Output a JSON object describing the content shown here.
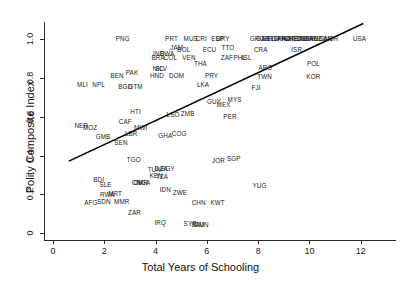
{
  "chart_data": {
    "type": "scatter",
    "title": "",
    "xlabel": "Total Years of Schooling",
    "ylabel": "Polity Composite Index",
    "xlim": [
      -0.35,
      13.1
    ],
    "ylim": [
      -0.035,
      1.09
    ],
    "xticks": [
      0,
      2,
      4,
      6,
      8,
      10,
      12
    ],
    "xticklabels": [
      "0",
      "2",
      "4",
      "6",
      "8",
      "10",
      "12"
    ],
    "yticks": [
      0,
      0.2,
      0.4,
      0.6,
      0.8,
      1.0
    ],
    "yticklabels": [
      "0",
      "0.2",
      "0.4",
      "0.6",
      "0.8",
      "1.0"
    ],
    "grid": false,
    "legend": null,
    "marker_style": "text-label",
    "trendline": {
      "type": "linear",
      "x_start": 0.62,
      "y_start": 0.372,
      "x_end": 12.1,
      "y_end": 1.082,
      "color": "#000000"
    },
    "points": [
      {
        "label": "PNG",
        "x": 2.72,
        "y": 1.0
      },
      {
        "label": "PRT",
        "x": 4.62,
        "y": 1.0
      },
      {
        "label": "MUS",
        "x": 5.37,
        "y": 1.0
      },
      {
        "label": "CRI",
        "x": 5.78,
        "y": 1.0
      },
      {
        "label": "ESP",
        "x": 6.42,
        "y": 1.0
      },
      {
        "label": "URY",
        "x": 6.62,
        "y": 1.0
      },
      {
        "label": "GRC",
        "x": 7.95,
        "y": 1.0
      },
      {
        "label": "GAB",
        "x": 8.18,
        "y": 1.0
      },
      {
        "label": "BEL",
        "x": 8.4,
        "y": 1.0
      },
      {
        "label": "IRL",
        "x": 8.55,
        "y": 1.0
      },
      {
        "label": "ITA",
        "x": 8.7,
        "y": 1.0
      },
      {
        "label": "JPN",
        "x": 8.85,
        "y": 1.0
      },
      {
        "label": "FRA",
        "x": 9.0,
        "y": 1.0
      },
      {
        "label": "AUT",
        "x": 9.15,
        "y": 1.0
      },
      {
        "label": "CHE",
        "x": 9.3,
        "y": 1.0
      },
      {
        "label": "NLD",
        "x": 9.45,
        "y": 1.0
      },
      {
        "label": "FIN",
        "x": 9.6,
        "y": 1.0
      },
      {
        "label": "DNK",
        "x": 9.75,
        "y": 1.0
      },
      {
        "label": "GBR",
        "x": 9.9,
        "y": 1.0
      },
      {
        "label": "SWE",
        "x": 10.05,
        "y": 1.0
      },
      {
        "label": "AUS",
        "x": 10.25,
        "y": 1.0
      },
      {
        "label": "NZL",
        "x": 10.4,
        "y": 1.0
      },
      {
        "label": "CAN",
        "x": 10.62,
        "y": 1.0
      },
      {
        "label": "NOR",
        "x": 10.85,
        "y": 1.0
      },
      {
        "label": "USA",
        "x": 11.95,
        "y": 1.0
      },
      {
        "label": "JAM",
        "x": 4.82,
        "y": 0.955
      },
      {
        "label": "BOL",
        "x": 5.1,
        "y": 0.945
      },
      {
        "label": "ECU",
        "x": 6.1,
        "y": 0.945
      },
      {
        "label": "TTO",
        "x": 6.82,
        "y": 0.955
      },
      {
        "label": "CRA",
        "x": 8.1,
        "y": 0.945
      },
      {
        "label": "IND",
        "x": 4.12,
        "y": 0.925
      },
      {
        "label": "BWA",
        "x": 4.45,
        "y": 0.925
      },
      {
        "label": "BRA",
        "x": 4.1,
        "y": 0.905
      },
      {
        "label": "COL",
        "x": 4.58,
        "y": 0.905
      },
      {
        "label": "VEN",
        "x": 5.3,
        "y": 0.905
      },
      {
        "label": "ZAF",
        "x": 6.78,
        "y": 0.905
      },
      {
        "label": "PHL",
        "x": 7.28,
        "y": 0.905
      },
      {
        "label": "ISL",
        "x": 7.55,
        "y": 0.905
      },
      {
        "label": "ISR",
        "x": 9.5,
        "y": 0.945
      },
      {
        "label": "POL",
        "x": 10.15,
        "y": 0.875
      },
      {
        "label": "THA",
        "x": 5.75,
        "y": 0.875
      },
      {
        "label": "NIC",
        "x": 4.1,
        "y": 0.845
      },
      {
        "label": "SLV",
        "x": 4.22,
        "y": 0.845
      },
      {
        "label": "ARG",
        "x": 8.28,
        "y": 0.855
      },
      {
        "label": "BEN",
        "x": 2.5,
        "y": 0.81
      },
      {
        "label": "PAK",
        "x": 3.08,
        "y": 0.825
      },
      {
        "label": "HND",
        "x": 4.05,
        "y": 0.81
      },
      {
        "label": "DOM",
        "x": 4.82,
        "y": 0.81
      },
      {
        "label": "PRY",
        "x": 6.18,
        "y": 0.81
      },
      {
        "label": "TWN",
        "x": 8.25,
        "y": 0.805
      },
      {
        "label": "KOR",
        "x": 10.15,
        "y": 0.805
      },
      {
        "label": "MLI",
        "x": 1.15,
        "y": 0.765
      },
      {
        "label": "NPL",
        "x": 1.78,
        "y": 0.765
      },
      {
        "label": "BGD",
        "x": 2.82,
        "y": 0.755
      },
      {
        "label": "GTM",
        "x": 3.22,
        "y": 0.755
      },
      {
        "label": "LKA",
        "x": 5.85,
        "y": 0.765
      },
      {
        "label": "FJI",
        "x": 7.92,
        "y": 0.75
      },
      {
        "label": "GUY",
        "x": 6.28,
        "y": 0.675
      },
      {
        "label": "MEX",
        "x": 6.65,
        "y": 0.66
      },
      {
        "label": "MYS",
        "x": 7.08,
        "y": 0.685
      },
      {
        "label": "HTI",
        "x": 3.22,
        "y": 0.625
      },
      {
        "label": "LSO",
        "x": 4.68,
        "y": 0.61
      },
      {
        "label": "ZMB",
        "x": 5.25,
        "y": 0.615
      },
      {
        "label": "PER",
        "x": 6.9,
        "y": 0.6
      },
      {
        "label": "CAF",
        "x": 2.82,
        "y": 0.575
      },
      {
        "label": "NER",
        "x": 1.1,
        "y": 0.555
      },
      {
        "label": "MOZ",
        "x": 1.45,
        "y": 0.545
      },
      {
        "label": "MWI",
        "x": 3.42,
        "y": 0.545
      },
      {
        "label": "LBR",
        "x": 3.05,
        "y": 0.51
      },
      {
        "label": "GMB",
        "x": 1.95,
        "y": 0.495
      },
      {
        "label": "GHA",
        "x": 4.38,
        "y": 0.5
      },
      {
        "label": "COG",
        "x": 4.92,
        "y": 0.51
      },
      {
        "label": "SEN",
        "x": 2.65,
        "y": 0.465
      },
      {
        "label": "TGO",
        "x": 3.15,
        "y": 0.38
      },
      {
        "label": "JOR",
        "x": 6.45,
        "y": 0.375
      },
      {
        "label": "SGP",
        "x": 7.05,
        "y": 0.385
      },
      {
        "label": "TUN",
        "x": 3.95,
        "y": 0.325
      },
      {
        "label": "DZA",
        "x": 4.22,
        "y": 0.33
      },
      {
        "label": "EGY",
        "x": 4.48,
        "y": 0.33
      },
      {
        "label": "KEN",
        "x": 4.02,
        "y": 0.295
      },
      {
        "label": "TZA",
        "x": 4.25,
        "y": 0.29
      },
      {
        "label": "BDI",
        "x": 1.78,
        "y": 0.275
      },
      {
        "label": "CIV",
        "x": 3.28,
        "y": 0.26
      },
      {
        "label": "NGA",
        "x": 3.52,
        "y": 0.26
      },
      {
        "label": "CMR",
        "x": 3.42,
        "y": 0.26
      },
      {
        "label": "SLE",
        "x": 2.05,
        "y": 0.25
      },
      {
        "label": "YUG",
        "x": 8.05,
        "y": 0.245
      },
      {
        "label": "IDN",
        "x": 4.38,
        "y": 0.225
      },
      {
        "label": "ZWE",
        "x": 4.95,
        "y": 0.205
      },
      {
        "label": "RWA",
        "x": 2.12,
        "y": 0.195
      },
      {
        "label": "MRT",
        "x": 2.42,
        "y": 0.2
      },
      {
        "label": "AFG",
        "x": 1.48,
        "y": 0.155
      },
      {
        "label": "SDN",
        "x": 1.98,
        "y": 0.16
      },
      {
        "label": "MMR",
        "x": 2.68,
        "y": 0.16
      },
      {
        "label": "CHN",
        "x": 5.68,
        "y": 0.155
      },
      {
        "label": "KWT",
        "x": 6.42,
        "y": 0.155
      },
      {
        "label": "ZAR",
        "x": 3.18,
        "y": 0.105
      },
      {
        "label": "IRQ",
        "x": 4.18,
        "y": 0.055
      },
      {
        "label": "SYR",
        "x": 5.35,
        "y": 0.05
      },
      {
        "label": "SAU",
        "x": 5.65,
        "y": 0.04
      },
      {
        "label": "OMN",
        "x": 5.78,
        "y": 0.04
      }
    ]
  }
}
